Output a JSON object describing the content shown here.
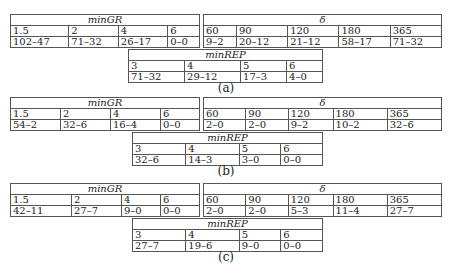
{
  "panels": [
    {
      "caption": "(a)",
      "minGR": {
        "title": "minGR",
        "params": [
          "1.5",
          "2",
          "4",
          "6"
        ],
        "values": [
          "102–47",
          "71–32",
          "26–17",
          "0–0"
        ]
      },
      "delta": {
        "title": "δ",
        "params": [
          "60",
          "90",
          "120",
          "180",
          "365"
        ],
        "values": [
          "9–2",
          "20–12",
          "21–12",
          "58–17",
          "71–32"
        ]
      },
      "minREP": {
        "title": "minREP",
        "params": [
          "3",
          "4",
          "5",
          "6"
        ],
        "values": [
          "71–32",
          "29–12",
          "17–3",
          "4–0"
        ]
      }
    },
    {
      "caption": "(b)",
      "minGR": {
        "title": "minGR",
        "params": [
          "1.5",
          "2",
          "4",
          "6"
        ],
        "values": [
          "54–2",
          "32–6",
          "16–4",
          "0–0"
        ]
      },
      "delta": {
        "title": "δ",
        "params": [
          "60",
          "90",
          "120",
          "180",
          "365"
        ],
        "values": [
          "2–0",
          "2–0",
          "9–2",
          "10–2",
          "32–6"
        ]
      },
      "minREP": {
        "title": "minREP",
        "params": [
          "3",
          "4",
          "5",
          "6"
        ],
        "values": [
          "32–6",
          "14–3",
          "3–0",
          "0–0"
        ]
      }
    },
    {
      "caption": "(c)",
      "minGR": {
        "title": "minGR",
        "params": [
          "1.5",
          "2",
          "4",
          "6"
        ],
        "values": [
          "42–11",
          "27–7",
          "9–0",
          "0–0"
        ]
      },
      "delta": {
        "title": "δ",
        "params": [
          "60",
          "90",
          "120",
          "180",
          "365"
        ],
        "values": [
          "2–0",
          "2–0",
          "5–3",
          "11–4",
          "27–7"
        ]
      },
      "minREP": {
        "title": "minREP",
        "params": [
          "3",
          "4",
          "5",
          "6"
        ],
        "values": [
          "27–7",
          "19–6",
          "9–0",
          "0–0"
        ]
      }
    }
  ]
}
